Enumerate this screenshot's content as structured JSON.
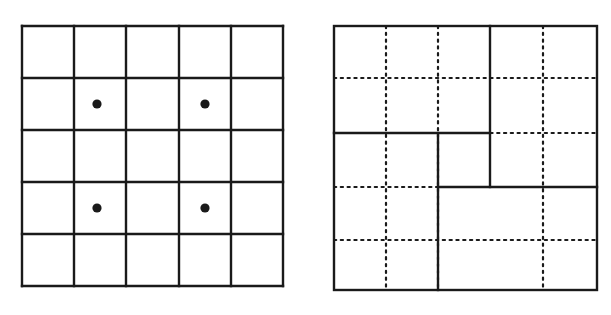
{
  "figure": {
    "canvas": {
      "width": 611,
      "height": 315,
      "background": "#ffffff"
    },
    "stroke_color": "#1a1a1a",
    "solid_stroke_width": 2.4,
    "dotted_stroke_width": 2.2,
    "dot_fill": "#1a1a1a",
    "panels": [
      {
        "name": "left-panel",
        "label": "5 by 5 square grid with four marked dots",
        "type": "uniform-grid",
        "bounds": {
          "x0": 22,
          "y0": 26,
          "x1": 283,
          "y1": 286
        },
        "rows": 5,
        "cols": 5,
        "cell_size": 52.0,
        "vertical_line_x": [
          22,
          74,
          126,
          179,
          231,
          283
        ],
        "horizontal_line_y": [
          26,
          78,
          130,
          182,
          234,
          286
        ],
        "dots": [
          {
            "name": "dot-r2c2",
            "row": 2,
            "col": 2,
            "cx": 97,
            "cy": 104,
            "r": 4.6
          },
          {
            "name": "dot-r2c4",
            "row": 2,
            "col": 4,
            "cx": 205,
            "cy": 104,
            "r": 4.6
          },
          {
            "name": "dot-r4c2",
            "row": 4,
            "col": 2,
            "cx": 97,
            "cy": 208,
            "r": 4.6
          },
          {
            "name": "dot-r4c4",
            "row": 4,
            "col": 4,
            "cx": 205,
            "cy": 208,
            "r": 4.6
          }
        ]
      },
      {
        "name": "right-panel",
        "label": "Square partitioned into four rectangles by solid lines over a dotted grid",
        "type": "partitioned-square",
        "bounds": {
          "x0": 334,
          "y0": 26,
          "x1": 597,
          "y1": 290
        },
        "solid_partitions": [
          {
            "name": "partition-vertical-upper",
            "orientation": "vertical",
            "x": 490,
            "y_from": 26,
            "y_to": 187
          },
          {
            "name": "partition-horizontal-upper-left",
            "orientation": "horizontal",
            "y": 133,
            "x_from": 334,
            "x_to": 490
          },
          {
            "name": "partition-vertical-lower",
            "orientation": "vertical",
            "x": 438,
            "y_from": 133,
            "y_to": 290
          },
          {
            "name": "partition-horizontal-lower-right",
            "orientation": "horizontal",
            "y": 187,
            "x_from": 438,
            "x_to": 597
          }
        ],
        "dotted_grid": {
          "vertical_line_x": [
            386,
            438,
            543
          ],
          "horizontal_line_y": [
            78,
            133,
            187,
            240
          ],
          "dash_on": 2.2,
          "dash_off": 4.6
        },
        "regions": [
          {
            "name": "region-top-left",
            "x0": 334,
            "y0": 26,
            "x1": 490,
            "y1": 133
          },
          {
            "name": "region-right-upper",
            "x0": 490,
            "y0": 26,
            "x1": 597,
            "y1": 187
          },
          {
            "name": "region-middle-left",
            "x0": 334,
            "y0": 133,
            "x1": 438,
            "y1": 290
          },
          {
            "name": "region-middle-small",
            "x0": 438,
            "y0": 133,
            "x1": 490,
            "y1": 187
          },
          {
            "name": "region-bottom-right",
            "x0": 438,
            "y0": 187,
            "x1": 597,
            "y1": 290
          }
        ]
      }
    ]
  }
}
